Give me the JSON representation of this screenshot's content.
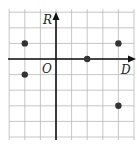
{
  "chart_data": {
    "type": "scatter",
    "title": "",
    "xlabel": "D",
    "ylabel": "R",
    "origin_label": "O",
    "xlim": [
      -3,
      5
    ],
    "ylim": [
      -5,
      3
    ],
    "grid": true,
    "points": [
      {
        "x": -2,
        "y": 1
      },
      {
        "x": -2,
        "y": -1
      },
      {
        "x": 2,
        "y": 0
      },
      {
        "x": 4,
        "y": 1
      },
      {
        "x": 4,
        "y": -3
      }
    ]
  },
  "colors": {
    "grid": "#b8b8b8",
    "axis": "#111111",
    "point": "#333333"
  }
}
